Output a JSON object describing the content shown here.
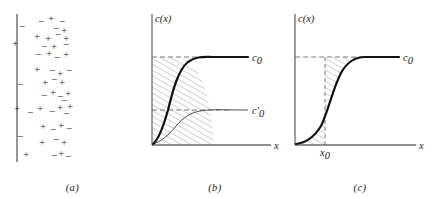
{
  "figure": {
    "background": "#ffffff",
    "ink": "#1a1a1a",
    "axis_color": "#6b6b6b",
    "hatch_color": "#8a8a8a",
    "dash_color": "#7a7a7a"
  },
  "panels": [
    {
      "id": "a",
      "caption": "(a)",
      "type": "schematic",
      "description": "charged wall with scattered positive and negative ions",
      "wall": {
        "label": "wall-line"
      },
      "charges": [
        {
          "sign": "−",
          "x": 22,
          "y": 30
        },
        {
          "sign": "−",
          "x": 41,
          "y": 25
        },
        {
          "sign": "+",
          "x": 51,
          "y": 22
        },
        {
          "sign": "−",
          "x": 62,
          "y": 25
        },
        {
          "sign": "−",
          "x": 56,
          "y": 32
        },
        {
          "sign": "+",
          "x": 64,
          "y": 34
        },
        {
          "sign": "+",
          "x": 37,
          "y": 40
        },
        {
          "sign": "+",
          "x": 48,
          "y": 42
        },
        {
          "sign": "−",
          "x": 58,
          "y": 38
        },
        {
          "sign": "+",
          "x": 66,
          "y": 42
        },
        {
          "sign": "+",
          "x": 15,
          "y": 47
        },
        {
          "sign": "−",
          "x": 44,
          "y": 50
        },
        {
          "sign": "+",
          "x": 54,
          "y": 50
        },
        {
          "sign": "−",
          "x": 66,
          "y": 48
        },
        {
          "sign": "−",
          "x": 38,
          "y": 58
        },
        {
          "sign": "+",
          "x": 49,
          "y": 57
        },
        {
          "sign": "−",
          "x": 57,
          "y": 61
        },
        {
          "sign": "+",
          "x": 66,
          "y": 58
        },
        {
          "sign": "+",
          "x": 37,
          "y": 73
        },
        {
          "sign": "−",
          "x": 52,
          "y": 74
        },
        {
          "sign": "+",
          "x": 60,
          "y": 77
        },
        {
          "sign": "−",
          "x": 69,
          "y": 74
        },
        {
          "sign": "−",
          "x": 20,
          "y": 88
        },
        {
          "sign": "+",
          "x": 45,
          "y": 86
        },
        {
          "sign": "−",
          "x": 54,
          "y": 83
        },
        {
          "sign": "+",
          "x": 62,
          "y": 86
        },
        {
          "sign": "−",
          "x": 44,
          "y": 99
        },
        {
          "sign": "+",
          "x": 53,
          "y": 96
        },
        {
          "sign": "−",
          "x": 60,
          "y": 100
        },
        {
          "sign": "+",
          "x": 68,
          "y": 97
        },
        {
          "sign": "−",
          "x": 64,
          "y": 104
        },
        {
          "sign": "+",
          "x": 17,
          "y": 112
        },
        {
          "sign": "−",
          "x": 30,
          "y": 116
        },
        {
          "sign": "+",
          "x": 40,
          "y": 112
        },
        {
          "sign": "−",
          "x": 52,
          "y": 115
        },
        {
          "sign": "+",
          "x": 60,
          "y": 111
        },
        {
          "sign": "+",
          "x": 70,
          "y": 110
        },
        {
          "sign": "−",
          "x": 66,
          "y": 117
        },
        {
          "sign": "+",
          "x": 43,
          "y": 130
        },
        {
          "sign": "−",
          "x": 53,
          "y": 133
        },
        {
          "sign": "+",
          "x": 61,
          "y": 129
        },
        {
          "sign": "−",
          "x": 69,
          "y": 132
        },
        {
          "sign": "−",
          "x": 20,
          "y": 140
        },
        {
          "sign": "+",
          "x": 42,
          "y": 146
        },
        {
          "sign": "−",
          "x": 56,
          "y": 143
        },
        {
          "sign": "+",
          "x": 64,
          "y": 146
        },
        {
          "sign": "+",
          "x": 26,
          "y": 158
        },
        {
          "sign": "−",
          "x": 54,
          "y": 159
        },
        {
          "sign": "+",
          "x": 61,
          "y": 157
        },
        {
          "sign": "−",
          "x": 68,
          "y": 160
        }
      ]
    },
    {
      "id": "b",
      "caption": "(b)",
      "type": "line",
      "y_axis_label": "c(x)",
      "x_axis_label": "x",
      "curves": [
        {
          "name": "bold-curve",
          "label": "c₀",
          "label_main": "c",
          "label_sub": "0",
          "label_prime": "",
          "style": "bold",
          "plateau_level": "c0"
        },
        {
          "name": "thin-curve",
          "label": "c₀′",
          "label_main": "c",
          "label_sub": "0",
          "label_prime": "′",
          "style": "thin",
          "plateau_level": "c0prime"
        }
      ],
      "dashed_levels": [
        "c₀",
        "c₀′"
      ],
      "hatched_region": "between y-axis and bold curve below c₀"
    },
    {
      "id": "c",
      "caption": "(c)",
      "type": "line",
      "y_axis_label": "c(x)",
      "x_axis_label": "x",
      "x_tick_label": "x₀",
      "x_tick_main": "x",
      "x_tick_sub": "0",
      "curves": [
        {
          "name": "bold-curve",
          "label": "c₀",
          "label_main": "c",
          "label_sub": "0",
          "label_prime": "",
          "style": "bold",
          "plateau_level": "c0"
        }
      ],
      "dashed_levels": [
        "c₀"
      ],
      "dashed_verticals": [
        "x₀"
      ],
      "hatched_region": "between bold curve and vertical dashed line at x₀"
    }
  ],
  "chart_data": [
    {
      "type": "line",
      "panel": "b",
      "title": "",
      "xlabel": "x",
      "ylabel": "c(x)",
      "xlim": [
        0,
        1
      ],
      "ylim": [
        0,
        1
      ],
      "grid": false,
      "legend": "inline-right",
      "annotations": [
        "c₀",
        "c₀′"
      ],
      "series": [
        {
          "name": "c₀",
          "style": "bold",
          "x": [
            0.0,
            0.04,
            0.08,
            0.12,
            0.16,
            0.2,
            0.26,
            0.32,
            0.4,
            0.5,
            0.62,
            0.75,
            0.88,
            1.0
          ],
          "y": [
            0.02,
            0.06,
            0.13,
            0.24,
            0.39,
            0.55,
            0.73,
            0.84,
            0.92,
            0.96,
            0.975,
            0.98,
            0.98,
            0.98
          ]
        },
        {
          "name": "c₀′",
          "style": "thin",
          "x": [
            0.0,
            0.05,
            0.12,
            0.2,
            0.28,
            0.36,
            0.45,
            0.55,
            0.66,
            0.78,
            0.9,
            1.0
          ],
          "y": [
            0.01,
            0.04,
            0.1,
            0.19,
            0.29,
            0.38,
            0.45,
            0.49,
            0.515,
            0.525,
            0.53,
            0.53
          ]
        }
      ]
    },
    {
      "type": "line",
      "panel": "c",
      "title": "",
      "xlabel": "x",
      "ylabel": "c(x)",
      "xlim": [
        0,
        1
      ],
      "ylim": [
        0,
        1
      ],
      "grid": false,
      "legend": "inline-right",
      "annotations": [
        "c₀",
        "x₀"
      ],
      "x_marker": 0.3,
      "series": [
        {
          "name": "c₀",
          "style": "bold",
          "x": [
            0.0,
            0.06,
            0.12,
            0.18,
            0.24,
            0.3,
            0.36,
            0.44,
            0.52,
            0.62,
            0.74,
            0.86,
            1.0
          ],
          "y": [
            0.02,
            0.05,
            0.1,
            0.19,
            0.32,
            0.48,
            0.64,
            0.8,
            0.9,
            0.955,
            0.975,
            0.98,
            0.98
          ]
        }
      ]
    }
  ]
}
